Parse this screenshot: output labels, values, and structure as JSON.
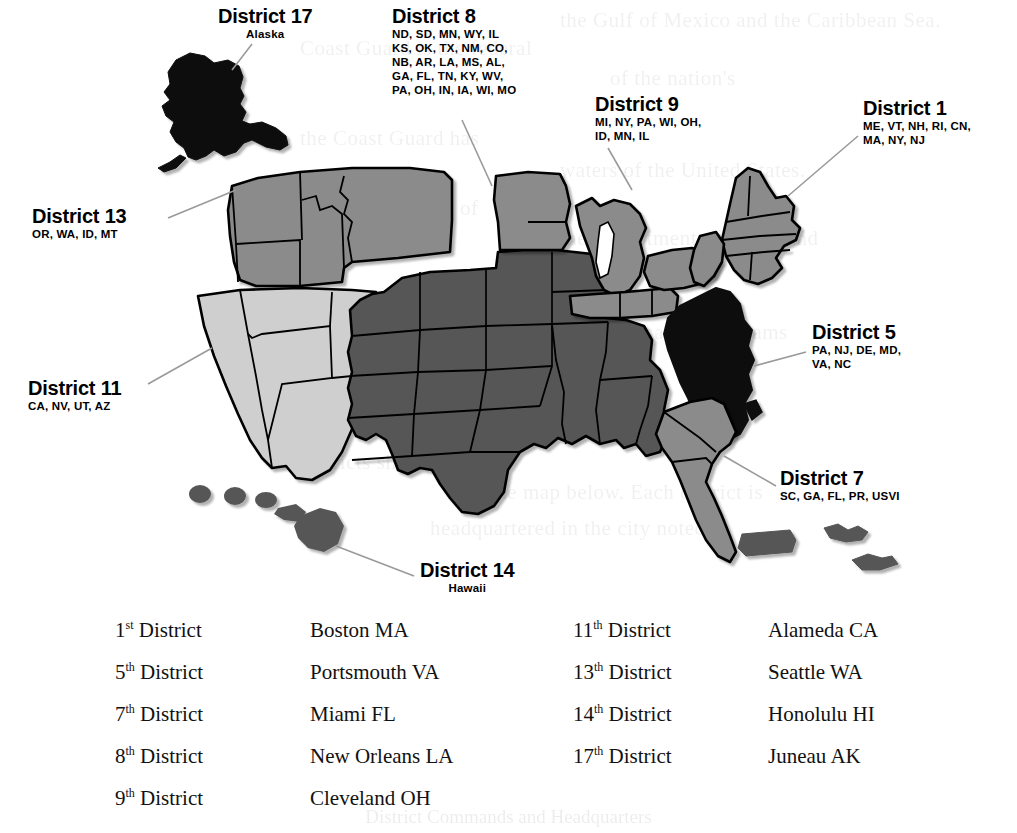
{
  "figure": {
    "background_color": "#ffffff"
  },
  "palette": {
    "black": "#0b0b0b",
    "dark_gray": "#565656",
    "medium_gray": "#8b8b8b",
    "light_gray": "#cfcfcf",
    "outline": "#000000",
    "leader_line": "#9a9a9a"
  },
  "callouts": [
    {
      "id": "district-17",
      "title": "District 17",
      "subtitle": "Alaska",
      "shade": "black",
      "align": "center",
      "left": 218,
      "top": 6
    },
    {
      "id": "district-8",
      "title": "District 8",
      "subtitle": "ND, SD, MN, WY, IL\nKS, OK, TX, NM, CO,\nNB, AR, LA, MS, AL,\nGA, FL, TN, KY, WV,\nPA, OH, IN, IA, WI, MO",
      "shade": "dark_gray",
      "align": "left",
      "left": 392,
      "top": 6
    },
    {
      "id": "district-9",
      "title": "District 9",
      "subtitle": "MI, NY, PA, WI, OH,\nID, MN, IL",
      "shade": "medium_gray",
      "align": "left",
      "left": 595,
      "top": 94
    },
    {
      "id": "district-1",
      "title": "District 1",
      "subtitle": "ME, VT, NH, RI, CN,\nMA, NY, NJ",
      "shade": "medium_gray",
      "align": "left",
      "left": 863,
      "top": 98
    },
    {
      "id": "district-13",
      "title": "District 13",
      "subtitle": "OR, WA, ID, MT",
      "shade": "medium_gray",
      "align": "left",
      "left": 32,
      "top": 206
    },
    {
      "id": "district-5",
      "title": "District 5",
      "subtitle": "PA, NJ, DE, MD,\nVA, NC",
      "shade": "black",
      "align": "left",
      "left": 812,
      "top": 322
    },
    {
      "id": "district-11",
      "title": "District 11",
      "subtitle": "CA, NV, UT, AZ",
      "shade": "light_gray",
      "align": "left",
      "left": 28,
      "top": 378
    },
    {
      "id": "district-7",
      "title": "District 7",
      "subtitle": "SC, GA, FL, PR, USVI",
      "shade": "medium_gray",
      "align": "left",
      "left": 780,
      "top": 468
    },
    {
      "id": "district-14",
      "title": "District 14",
      "subtitle": "Hawaii",
      "shade": "dark_gray",
      "align": "center",
      "left": 420,
      "top": 560
    }
  ],
  "district_list": {
    "left_column": [
      {
        "ordinal_number": "1",
        "ordinal_suffix": "st",
        "ordinal_word": " District",
        "city": "Boston MA"
      },
      {
        "ordinal_number": "5",
        "ordinal_suffix": "th",
        "ordinal_word": " District",
        "city": "Portsmouth VA"
      },
      {
        "ordinal_number": "7",
        "ordinal_suffix": "th",
        "ordinal_word": " District",
        "city": "Miami FL"
      },
      {
        "ordinal_number": "8",
        "ordinal_suffix": "th",
        "ordinal_word": " District",
        "city": "New Orleans LA"
      },
      {
        "ordinal_number": "9",
        "ordinal_suffix": "th",
        "ordinal_word": " District",
        "city": "Cleveland OH"
      }
    ],
    "right_column": [
      {
        "ordinal_number": "11",
        "ordinal_suffix": "th",
        "ordinal_word": " District",
        "city": "Alameda CA"
      },
      {
        "ordinal_number": "13",
        "ordinal_suffix": "th",
        "ordinal_word": " District",
        "city": "Seattle WA"
      },
      {
        "ordinal_number": "14",
        "ordinal_suffix": "th",
        "ordinal_word": " District",
        "city": "Honolulu HI"
      },
      {
        "ordinal_number": "17",
        "ordinal_suffix": "th",
        "ordinal_word": " District",
        "city": "Juneau AK"
      }
    ]
  },
  "bleed_through": {
    "lines": [
      {
        "text": "the Gulf of Mexico and the Caribbean Sea.",
        "left": 560,
        "top": 8,
        "size": 21
      },
      {
        "text": "Coast Guard is the federal",
        "left": 300,
        "top": 36,
        "size": 21
      },
      {
        "text": "of the nation's",
        "left": 610,
        "top": 66,
        "size": 21
      },
      {
        "text": "the Coast Guard has",
        "left": 300,
        "top": 126,
        "size": 21
      },
      {
        "text": "waters of the United States.",
        "left": 560,
        "top": 158,
        "size": 21
      },
      {
        "text": "and the operation of",
        "left": 300,
        "top": 196,
        "size": 21
      },
      {
        "text": "the Department of Homeland",
        "left": 560,
        "top": 226,
        "size": 21
      },
      {
        "text": "responsibilities include",
        "left": 300,
        "top": 290,
        "size": 21
      },
      {
        "text": "maritime safety programs",
        "left": 560,
        "top": 320,
        "size": 21
      },
      {
        "text": "enforcement of",
        "left": 300,
        "top": 386,
        "size": 21
      },
      {
        "text": "and navigation",
        "left": 560,
        "top": 416,
        "size": 21
      },
      {
        "text": "districts shown",
        "left": 300,
        "top": 450,
        "size": 21
      },
      {
        "text": "the map below. Each district is",
        "left": 490,
        "top": 480,
        "size": 21
      },
      {
        "text": "headquartered in the city noted.",
        "left": 430,
        "top": 516,
        "size": 21
      }
    ],
    "footer": "District Commands and Headquarters"
  }
}
